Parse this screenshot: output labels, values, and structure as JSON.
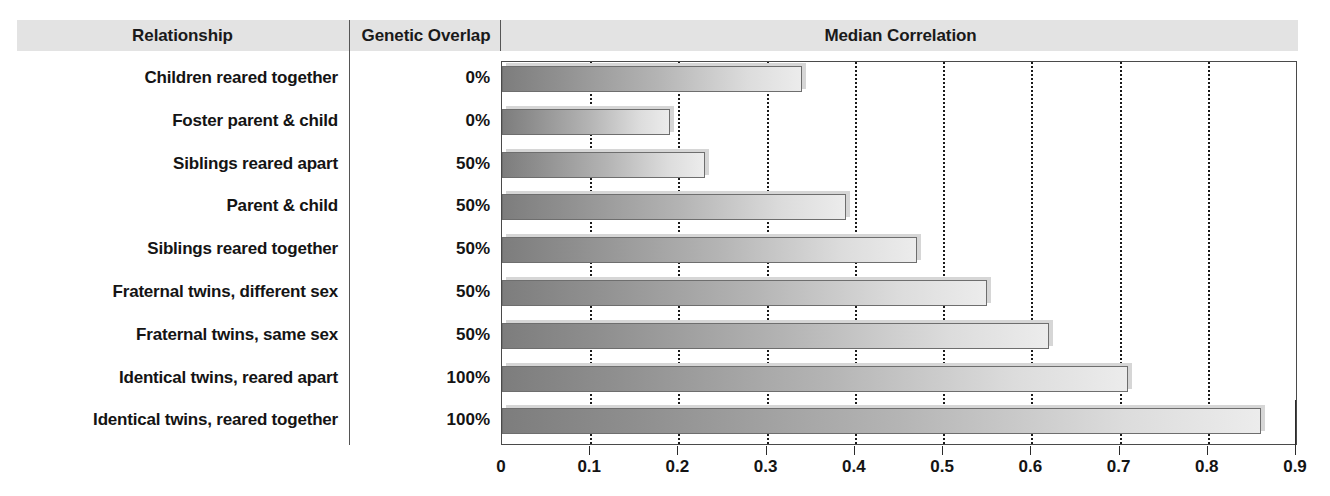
{
  "columns": {
    "relationship_header": "Relationship",
    "overlap_header": "Genetic Overlap",
    "median_header": "Median Correlation"
  },
  "rows": [
    {
      "relationship": "Children reared together",
      "overlap": "0%",
      "correlation": 0.34
    },
    {
      "relationship": "Foster parent & child",
      "overlap": "0%",
      "correlation": 0.19
    },
    {
      "relationship": "Siblings reared apart",
      "overlap": "50%",
      "correlation": 0.23
    },
    {
      "relationship": "Parent & child",
      "overlap": "50%",
      "correlation": 0.39
    },
    {
      "relationship": "Siblings reared together",
      "overlap": "50%",
      "correlation": 0.47
    },
    {
      "relationship": "Fraternal twins, different sex",
      "overlap": "50%",
      "correlation": 0.55
    },
    {
      "relationship": "Fraternal twins, same sex",
      "overlap": "50%",
      "correlation": 0.62
    },
    {
      "relationship": "Identical twins, reared apart",
      "overlap": "100%",
      "correlation": 0.71
    },
    {
      "relationship": "Identical twins, reared together",
      "overlap": "100%",
      "correlation": 0.86
    }
  ],
  "axis": {
    "ticks": [
      "0",
      "0.1",
      "0.2",
      "0.3",
      "0.4",
      "0.5",
      "0.6",
      "0.7",
      "0.8",
      "0.9"
    ],
    "min": 0,
    "max": 0.9
  },
  "colors": {
    "header_band": "#e3e3e3",
    "bar_start": "#7d7d7d",
    "bar_end": "#ececec",
    "bar_border": "#6e6e6e",
    "gridline": "#1a1a1a",
    "text": "#141414"
  },
  "chart_data": {
    "type": "bar",
    "orientation": "horizontal",
    "title": "Median Correlation",
    "xlabel": "",
    "ylabel": "",
    "xlim": [
      0,
      0.9
    ],
    "grid": "vertical-dotted",
    "legend": "none",
    "categories": [
      "Children reared together",
      "Foster parent & child",
      "Siblings reared apart",
      "Parent & child",
      "Siblings reared together",
      "Fraternal twins, different sex",
      "Fraternal twins, same sex",
      "Identical twins, reared apart",
      "Identical twins, reared together"
    ],
    "values": [
      0.34,
      0.19,
      0.23,
      0.39,
      0.47,
      0.55,
      0.62,
      0.71,
      0.86
    ],
    "secondary_column": {
      "name": "Genetic Overlap",
      "values": [
        "0%",
        "0%",
        "50%",
        "50%",
        "50%",
        "50%",
        "50%",
        "100%",
        "100%"
      ]
    },
    "tick_labels": [
      "0",
      "0.1",
      "0.2",
      "0.3",
      "0.4",
      "0.5",
      "0.6",
      "0.7",
      "0.8",
      "0.9"
    ]
  }
}
